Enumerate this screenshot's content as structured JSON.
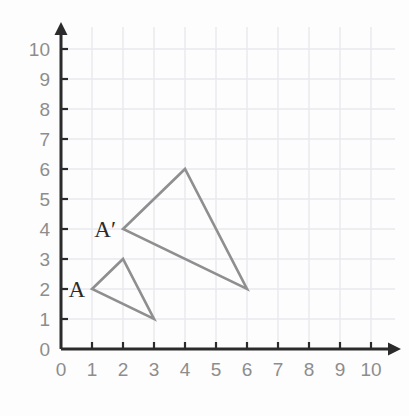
{
  "chart_data": {
    "type": "scatter",
    "title": "",
    "xlabel": "",
    "ylabel": "",
    "xlim": [
      0,
      10
    ],
    "ylim": [
      0,
      10
    ],
    "grid": true,
    "legend_position": "none",
    "x_ticks": [
      "0",
      "1",
      "2",
      "3",
      "4",
      "5",
      "6",
      "7",
      "8",
      "9",
      "10"
    ],
    "y_ticks": [
      "0",
      "1",
      "2",
      "3",
      "4",
      "5",
      "6",
      "7",
      "8",
      "9",
      "10"
    ],
    "shapes": [
      {
        "name": "triangle-a",
        "label": "A",
        "label_vertex": [
          1,
          2
        ],
        "vertices": [
          [
            1,
            2
          ],
          [
            2,
            3
          ],
          [
            3,
            1
          ]
        ],
        "stroke": "#8f8f8f",
        "fill": "none"
      },
      {
        "name": "triangle-a-prime",
        "label": "A′",
        "label_vertex": [
          2,
          4
        ],
        "vertices": [
          [
            2,
            4
          ],
          [
            4,
            6
          ],
          [
            6,
            2
          ]
        ],
        "stroke": "#8f8f8f",
        "fill": "none"
      }
    ],
    "annotations": [
      {
        "text": "A",
        "x": 1,
        "y": 2
      },
      {
        "text": "A′",
        "x": 2,
        "y": 4
      }
    ]
  },
  "colors": {
    "background": "#fdfdfd",
    "grid": "#e9e9ee",
    "axis": "#2b2b2b",
    "tick_label": "#8d8d8d",
    "shape_stroke": "#8f8f8f",
    "shape_label": "#2a2a2a"
  },
  "geometry": {
    "origin_x": 61,
    "origin_y": 349,
    "unit_x": 31,
    "unit_y": 30,
    "tick_len": 7,
    "axis_width": 3,
    "shape_stroke_width": 2.6,
    "grid_width": 1.4,
    "x_axis_end": 401,
    "y_axis_end": 22,
    "arrow_size": 8
  }
}
